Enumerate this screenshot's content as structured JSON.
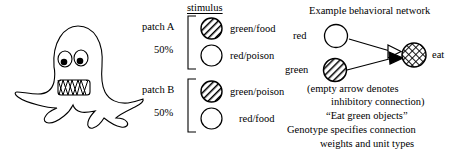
{
  "figure": {
    "background_color": "#ffffff",
    "ink_color": "#000000"
  },
  "creature": {
    "name": "artificial-organism",
    "description": "cartoon octopus-like creature with two eyes and a toothy mouth"
  },
  "stimulus": {
    "header": "stimulus",
    "patches": [
      {
        "label": "patch A",
        "percent": "50%",
        "options": [
          {
            "fill": "hatched",
            "text": "green/food"
          },
          {
            "fill": "empty",
            "text": "red/poison"
          }
        ]
      },
      {
        "label": "patch B",
        "percent": "50%",
        "options": [
          {
            "fill": "hatched",
            "text": "green/poison"
          },
          {
            "fill": "empty",
            "text": "red/food"
          }
        ]
      }
    ]
  },
  "network": {
    "title": "Example behavioral network",
    "nodes": [
      {
        "id": "red",
        "label": "red",
        "fill": "empty"
      },
      {
        "id": "green",
        "label": "green",
        "fill": "hatched"
      },
      {
        "id": "eat",
        "label": "eat",
        "fill": "crosshatch"
      }
    ],
    "edges": [
      {
        "from": "red",
        "to": "eat",
        "arrow": "empty",
        "meaning": "inhibitory"
      },
      {
        "from": "green",
        "to": "eat",
        "arrow": "filled",
        "meaning": "excitatory"
      }
    ],
    "captions": [
      "(empty arrow denotes",
      "inhibitory connection)",
      "“Eat green objects”",
      "Genotype specifies connection",
      "weights and unit types"
    ]
  }
}
